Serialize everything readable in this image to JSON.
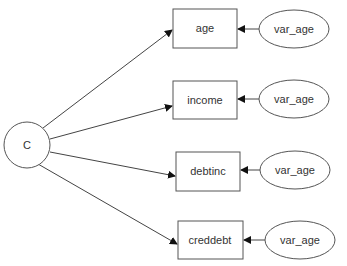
{
  "diagram": {
    "type": "path-diagram",
    "latent": {
      "id": "C",
      "label": "C",
      "cx": 27,
      "cy": 145,
      "r": 23
    },
    "observed": [
      {
        "id": "age",
        "label": "age",
        "x": 173,
        "y": 9,
        "w": 64,
        "h": 39
      },
      {
        "id": "income",
        "label": "income",
        "x": 173,
        "y": 81,
        "w": 64,
        "h": 38
      },
      {
        "id": "debtinc",
        "label": "debtinc",
        "x": 176,
        "y": 152,
        "w": 64,
        "h": 39
      },
      {
        "id": "creddebt",
        "label": "creddebt",
        "x": 178,
        "y": 221,
        "w": 65,
        "h": 38
      }
    ],
    "errors": [
      {
        "label": "var_age",
        "target": "age",
        "cx": 294,
        "cy": 29,
        "rx": 35,
        "ry": 19
      },
      {
        "label": "var_age",
        "target": "income",
        "cx": 294,
        "cy": 99,
        "rx": 35,
        "ry": 19
      },
      {
        "label": "var_age",
        "target": "debtinc",
        "cx": 295,
        "cy": 170,
        "rx": 35,
        "ry": 19
      },
      {
        "label": "var_age",
        "target": "creddebt",
        "cx": 300,
        "cy": 240,
        "rx": 35,
        "ry": 19
      }
    ],
    "edges": [
      {
        "from": "C",
        "to": "age"
      },
      {
        "from": "C",
        "to": "income"
      },
      {
        "from": "C",
        "to": "debtinc"
      },
      {
        "from": "C",
        "to": "creddebt"
      },
      {
        "from": "var_age",
        "to": "age"
      },
      {
        "from": "var_age",
        "to": "income"
      },
      {
        "from": "var_age",
        "to": "debtinc"
      },
      {
        "from": "var_age",
        "to": "creddebt"
      }
    ],
    "colors": {
      "stroke": "#555555",
      "text": "#333333",
      "background": "#ffffff"
    }
  }
}
